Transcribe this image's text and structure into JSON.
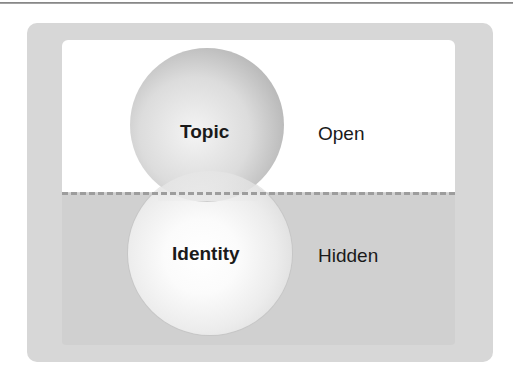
{
  "diagram": {
    "type": "layered-spheres",
    "regions": {
      "upper": {
        "label": "Open",
        "background": "#ffffff"
      },
      "lower": {
        "label": "Hidden",
        "background": "#d0d0d0"
      }
    },
    "spheres": [
      {
        "id": "topic",
        "label": "Topic",
        "region": "upper",
        "shade": "gray"
      },
      {
        "id": "identity",
        "label": "Identity",
        "region": "lower",
        "shade": "white"
      }
    ],
    "divider": {
      "style": "dashed",
      "color": "#9d9d9d"
    },
    "frame_color": "#d7d7d7"
  }
}
